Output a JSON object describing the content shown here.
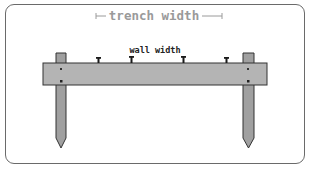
{
  "diagram": {
    "labels": {
      "trench_width": "trench width",
      "wall_width": "wall width"
    },
    "colors": {
      "frame_border": "#6a6a6a",
      "trench_label": "#9a9a9a",
      "wall_label": "#222222",
      "board_fill": "#b4b4b4",
      "stake_fill": "#a0a0a0",
      "outline": "#333333",
      "nail": "#1a1a1a"
    },
    "elements": {
      "stakes": 2,
      "nails": 4,
      "board": 1
    }
  }
}
